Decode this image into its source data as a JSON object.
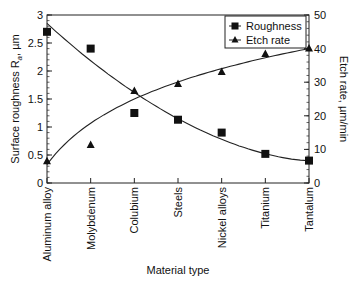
{
  "chart_data": {
    "type": "scatter",
    "title": "",
    "xlabel": "Material type",
    "ylabel_left": "Surface roughness R",
    "ylabel_left_sub": "a",
    "ylabel_left_unit": ", µm",
    "ylabel_right": "Etch rate, µm/min",
    "categories": [
      "Aluminum alloy",
      "Molybdenum",
      "Colubium",
      "Steels",
      "Nickel alloys",
      "Titanium",
      "Tantalum"
    ],
    "ylim_left": [
      0,
      3
    ],
    "ylim_right": [
      0,
      50
    ],
    "left_ticks": [
      "0",
      "0.5",
      "1",
      "1.5",
      "2",
      "2.5",
      "3"
    ],
    "right_ticks": [
      "0",
      "10",
      "20",
      "30",
      "40",
      "50"
    ],
    "grid": false,
    "legend_position": "upper right",
    "series": [
      {
        "name": "Roughness",
        "axis": "left",
        "marker": "square",
        "values": [
          2.7,
          2.4,
          1.25,
          1.13,
          0.9,
          0.52,
          0.4
        ],
        "trend_line": true
      },
      {
        "name": "Etch rate",
        "axis": "right",
        "marker": "triangle",
        "values": [
          6.5,
          11.3,
          27.4,
          29.5,
          33,
          38.4,
          40
        ],
        "trend_line": true
      }
    ]
  }
}
